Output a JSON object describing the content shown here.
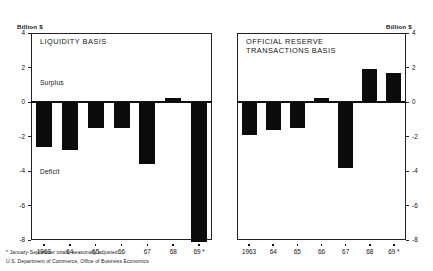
{
  "figure": {
    "axis_unit_label": "Billion $",
    "footnotes": [
      "* January-September totals, seasonally adjusted.",
      "U.S. Department of Commerce, Office of Business Economics"
    ]
  },
  "chart_data": [
    {
      "type": "bar",
      "title": "LIQUIDITY BASIS",
      "panel": "left",
      "categories": [
        "1963",
        "64",
        "65",
        "66",
        "67",
        "68",
        "69 *"
      ],
      "values": [
        -2.6,
        -2.8,
        -1.5,
        -1.5,
        -3.6,
        0.25,
        -8.1
      ],
      "xlabel": "",
      "ylabel": "Billion $",
      "ylim": [
        -8,
        4
      ],
      "yticks": [
        4,
        2,
        0,
        -2,
        -4,
        -6,
        -8
      ],
      "ytick_labels": [
        "4",
        "2",
        "0",
        "-2",
        "-4",
        "-6",
        "-8"
      ],
      "annotations": [
        "Surplus",
        "Deficit"
      ],
      "grid": false,
      "legend": "none",
      "bar_color": "#0b0b0b"
    },
    {
      "type": "bar",
      "title": "OFFICIAL RESERVE\nTRANSACTIONS BASIS",
      "panel": "right",
      "categories": [
        "1963",
        "64",
        "65",
        "66",
        "67",
        "68",
        "69 *"
      ],
      "values": [
        -1.9,
        -1.6,
        -1.5,
        0.25,
        -3.8,
        1.9,
        1.7
      ],
      "xlabel": "",
      "ylabel": "Billion $",
      "ylim": [
        -8,
        4
      ],
      "yticks": [
        4,
        2,
        0,
        -2,
        -4,
        -6,
        -8
      ],
      "ytick_labels": [
        "4",
        "2",
        "0",
        "-2",
        "-4",
        "-6",
        "-8"
      ],
      "annotations": [],
      "grid": false,
      "legend": "none",
      "bar_color": "#0b0b0b"
    }
  ]
}
